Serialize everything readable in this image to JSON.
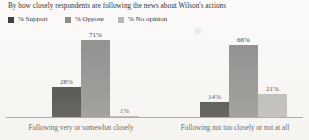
{
  "chart_data": {
    "type": "bar",
    "title": "By how closely respondents are following the news about Wilson's actions",
    "xlabel": "",
    "ylabel": "",
    "ylim": [
      0,
      80
    ],
    "grid": false,
    "legend_position": "top-left",
    "categories": [
      "Following very or somewhat closely",
      "Following not too closely or not at all"
    ],
    "series": [
      {
        "name": "% Support",
        "color": "#3a3836",
        "values": [
          28,
          14
        ],
        "labels": [
          "28%",
          "14%"
        ]
      },
      {
        "name": "% Oppose",
        "color": "#8b8a88",
        "values": [
          71,
          66
        ],
        "labels": [
          "71%",
          "66%"
        ]
      },
      {
        "name": "% No opinion",
        "color": "#b7b6b3",
        "values": [
          1,
          21
        ],
        "labels": [
          "1%",
          "21%"
        ]
      }
    ]
  },
  "legend": {
    "items": [
      {
        "label": "% Support",
        "swatch": "legend-swatch-support"
      },
      {
        "label": "% Oppose",
        "swatch": "legend-swatch-oppose"
      },
      {
        "label": "% No opinion",
        "swatch": "legend-swatch-no-opinion"
      }
    ]
  },
  "axis": {
    "baseline_color": "#9a9a9a"
  }
}
